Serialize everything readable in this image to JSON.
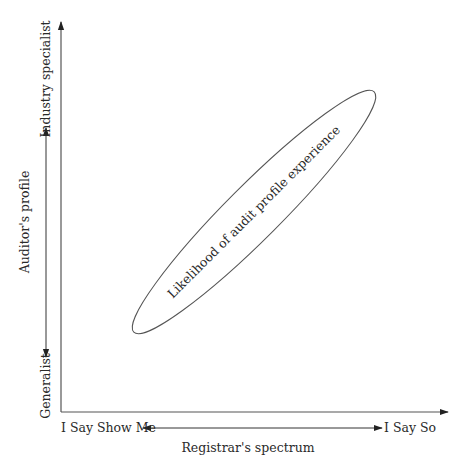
{
  "diagram": {
    "y_axis": {
      "title": "Auditor's profile",
      "top_label": "Industry specialist",
      "bottom_label": "Generalist"
    },
    "x_axis": {
      "title": "Registrar's spectrum",
      "left_label": "I Say Show Me",
      "right_label": "I Say So"
    },
    "region": {
      "label": "Likelihood of audit profile experience",
      "shape": "ellipse",
      "orientation": "diagonal rising left-bottom to right-top"
    },
    "colors": {
      "line": "#333333",
      "text": "#2a2a2a",
      "background": "#ffffff"
    }
  }
}
